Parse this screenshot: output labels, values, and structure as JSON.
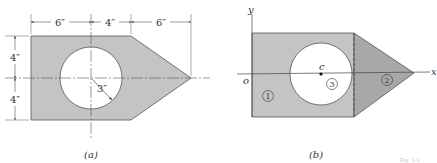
{
  "figure_a": {
    "caption": "(a)",
    "dimensions": {
      "top": [
        "6″",
        "4″",
        "6″"
      ],
      "left": [
        "4″",
        "4″"
      ],
      "radius": "3″"
    },
    "colors": {
      "fill": "#c4c4c4",
      "stroke": "#555555",
      "hole": "#ffffff"
    }
  },
  "figure_b": {
    "caption": "(b)",
    "axes": {
      "x": "x",
      "y": "y",
      "origin": "o"
    },
    "centroid_label": "c",
    "regions": [
      "1",
      "2",
      "3"
    ],
    "colors": {
      "rect_fill": "#c4c4c4",
      "triangle_fill": "#a8a8a8",
      "stroke": "#555555"
    }
  },
  "footer_fragment": "Fig. 1-5"
}
